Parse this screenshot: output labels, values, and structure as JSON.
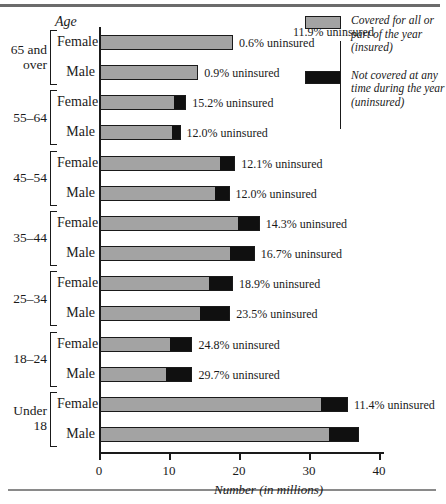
{
  "chart_data": {
    "type": "bar",
    "orientation": "horizontal",
    "stacked": true,
    "title": "",
    "xlabel": "Number (in millions)",
    "ylabel": "Age",
    "xlim": [
      0,
      40
    ],
    "xticks": [
      0,
      10,
      20,
      30,
      40
    ],
    "xticklabels": [
      "0",
      "10",
      "20",
      "30",
      "40"
    ],
    "grid": false,
    "legend_position": "top-right",
    "series": [
      {
        "name": "Covered for all or part of the year (insured)",
        "color": "#a3a3a3"
      },
      {
        "name": "Not covered at any time during the year (uninsured)",
        "color": "#101010"
      }
    ],
    "groups": [
      {
        "age": "65 and over",
        "rows": [
          {
            "sex": "Female",
            "insured": 18.9,
            "uninsured": 0.11,
            "total": 19.0,
            "pct_label": "0.6% uninsured"
          },
          {
            "sex": "Male",
            "insured": 13.9,
            "uninsured": 0.13,
            "total": 14.0,
            "pct_label": "0.9% uninsured"
          }
        ]
      },
      {
        "age": "55–64",
        "rows": [
          {
            "sex": "Female",
            "insured": 10.4,
            "uninsured": 1.9,
            "total": 12.3,
            "pct_label": "15.2% uninsured"
          },
          {
            "sex": "Male",
            "insured": 10.1,
            "uninsured": 1.4,
            "total": 11.5,
            "pct_label": "12.0% uninsured"
          }
        ]
      },
      {
        "age": "45–54",
        "rows": [
          {
            "sex": "Female",
            "insured": 17.0,
            "uninsured": 2.3,
            "total": 19.3,
            "pct_label": "12.1% uninsured"
          },
          {
            "sex": "Male",
            "insured": 16.3,
            "uninsured": 2.2,
            "total": 18.5,
            "pct_label": "12.0% uninsured"
          }
        ]
      },
      {
        "age": "35–44",
        "rows": [
          {
            "sex": "Female",
            "insured": 19.5,
            "uninsured": 3.3,
            "total": 22.8,
            "pct_label": "14.3% uninsured"
          },
          {
            "sex": "Male",
            "insured": 18.4,
            "uninsured": 3.7,
            "total": 22.1,
            "pct_label": "16.7% uninsured"
          }
        ]
      },
      {
        "age": "25–34",
        "rows": [
          {
            "sex": "Female",
            "insured": 15.4,
            "uninsured": 3.6,
            "total": 19.0,
            "pct_label": "18.9% uninsured"
          },
          {
            "sex": "Male",
            "insured": 14.2,
            "uninsured": 4.4,
            "total": 18.6,
            "pct_label": "23.5% uninsured"
          }
        ]
      },
      {
        "age": "18–24",
        "rows": [
          {
            "sex": "Female",
            "insured": 9.9,
            "uninsured": 3.3,
            "total": 13.2,
            "pct_label": "24.8% uninsured"
          },
          {
            "sex": "Male",
            "insured": 9.3,
            "uninsured": 3.9,
            "total": 13.2,
            "pct_label": "29.7% uninsured"
          }
        ]
      },
      {
        "age": "Under 18",
        "rows": [
          {
            "sex": "Female",
            "insured": 31.4,
            "uninsured": 4.0,
            "total": 35.4,
            "pct_label": "11.4% uninsured"
          },
          {
            "sex": "Male",
            "insured": 32.6,
            "uninsured": 4.4,
            "total": 37.0,
            "pct_label": "11.9% uninsured"
          }
        ]
      }
    ],
    "annotations": [
      {
        "text": "11.9% uninsured",
        "points_to": "Under 18 / Male"
      }
    ]
  },
  "axis": {
    "age_title": "Age",
    "x_caption": "Number (in millions)",
    "ticklabels": [
      "0",
      "10",
      "20",
      "30",
      "40"
    ]
  },
  "legend": {
    "items": [
      {
        "swatch": "gray",
        "text": "Covered for all or part of the year (insured)"
      },
      {
        "swatch": "black",
        "text": "Not covered at any time during the year (uninsured)"
      }
    ]
  },
  "groups": [
    {
      "age_line1": "65 and",
      "age_line2": "over",
      "rows": [
        {
          "sex": "Female",
          "pct_label": "0.6% uninsured"
        },
        {
          "sex": "Male",
          "pct_label": "0.9% uninsured"
        }
      ]
    },
    {
      "age_line1": "55–64",
      "age_line2": "",
      "rows": [
        {
          "sex": "Female",
          "pct_label": "15.2% uninsured"
        },
        {
          "sex": "Male",
          "pct_label": "12.0% uninsured"
        }
      ]
    },
    {
      "age_line1": "45–54",
      "age_line2": "",
      "rows": [
        {
          "sex": "Female",
          "pct_label": "12.1% uninsured"
        },
        {
          "sex": "Male",
          "pct_label": "12.0% uninsured"
        }
      ]
    },
    {
      "age_line1": "35–44",
      "age_line2": "",
      "rows": [
        {
          "sex": "Female",
          "pct_label": "14.3% uninsured"
        },
        {
          "sex": "Male",
          "pct_label": "16.7% uninsured"
        }
      ]
    },
    {
      "age_line1": "25–34",
      "age_line2": "",
      "rows": [
        {
          "sex": "Female",
          "pct_label": "18.9% uninsured"
        },
        {
          "sex": "Male",
          "pct_label": "23.5% uninsured"
        }
      ]
    },
    {
      "age_line1": "18–24",
      "age_line2": "",
      "rows": [
        {
          "sex": "Female",
          "pct_label": "24.8% uninsured"
        },
        {
          "sex": "Male",
          "pct_label": "29.7% uninsured"
        }
      ]
    },
    {
      "age_line1": "Under",
      "age_line2": "18",
      "rows": [
        {
          "sex": "Female",
          "pct_label": "11.4% uninsured"
        },
        {
          "sex": "Male",
          "pct_label": "11.9% uninsured"
        }
      ]
    }
  ],
  "callout": {
    "text": "11.9% uninsured"
  },
  "colors": {
    "insured": "#a3a3a3",
    "uninsured": "#101010",
    "axis": "#1a1a1a"
  }
}
